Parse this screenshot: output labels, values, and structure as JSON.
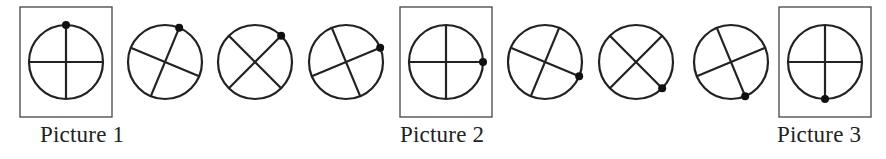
{
  "diagram": {
    "title": "",
    "stroke_color": "#222222",
    "frame_color": "#444444",
    "circle_radius": 37,
    "center_y": 62,
    "figures": [
      {
        "index": 1,
        "cx": 66,
        "angle": 0,
        "framed": true,
        "caption": "Picture 1"
      },
      {
        "index": 2,
        "cx": 165,
        "angle": 22.5,
        "framed": false
      },
      {
        "index": 3,
        "cx": 255,
        "angle": 45,
        "framed": false
      },
      {
        "index": 4,
        "cx": 346,
        "angle": 67.5,
        "framed": false
      },
      {
        "index": 5,
        "cx": 446,
        "angle": 90,
        "framed": true,
        "caption": "Picture 2"
      },
      {
        "index": 6,
        "cx": 545,
        "angle": 112.5,
        "framed": false
      },
      {
        "index": 7,
        "cx": 636,
        "angle": 135,
        "framed": false
      },
      {
        "index": 8,
        "cx": 731,
        "angle": 157.5,
        "framed": false
      },
      {
        "index": 9,
        "cx": 825,
        "angle": 180,
        "framed": true,
        "caption": "Picture 3"
      }
    ]
  },
  "captions": {
    "picture1": "Picture 1",
    "picture2": "Picture 2",
    "picture3": "Picture 3"
  }
}
